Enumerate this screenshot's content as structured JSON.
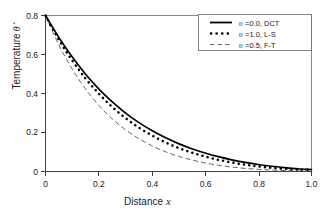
{
  "chart_data": {
    "type": "line",
    "title": "",
    "xlabel": "Distance x",
    "ylabel": "Temperature θ",
    "ylabel_sub": "*",
    "xlim": [
      0,
      1.0
    ],
    "ylim": [
      0,
      0.8
    ],
    "grid": false,
    "legend_position": "upper-right",
    "xticks": [
      "0",
      "0.2",
      "0.4",
      "0.6",
      "0.8",
      "1.0"
    ],
    "xtick_values": [
      0,
      0.2,
      0.4,
      0.6,
      0.8,
      1.0
    ],
    "yticks": [
      "0",
      "0.2",
      "0.4",
      "0.6",
      "0.8"
    ],
    "ytick_values": [
      0,
      0.2,
      0.4,
      0.6,
      0.8
    ],
    "x": [
      0,
      0.05,
      0.1,
      0.15,
      0.2,
      0.25,
      0.3,
      0.35,
      0.4,
      0.45,
      0.5,
      0.55,
      0.6,
      0.65,
      0.7,
      0.75,
      0.8,
      0.85,
      0.9,
      0.95,
      1.0
    ],
    "series": [
      {
        "name": "υ =0.0, DCT",
        "style": "solid",
        "color": "#000000",
        "values": [
          0.8,
          0.688,
          0.588,
          0.5,
          0.424,
          0.358,
          0.301,
          0.252,
          0.21,
          0.174,
          0.143,
          0.117,
          0.095,
          0.076,
          0.06,
          0.047,
          0.036,
          0.027,
          0.02,
          0.014,
          0.01
        ]
      },
      {
        "name": "υ =1.0, L-S",
        "style": "dotted",
        "color": "#000000",
        "values": [
          0.8,
          0.676,
          0.57,
          0.478,
          0.4,
          0.332,
          0.275,
          0.226,
          0.185,
          0.15,
          0.121,
          0.097,
          0.077,
          0.06,
          0.046,
          0.035,
          0.026,
          0.019,
          0.014,
          0.01,
          0.008
        ]
      },
      {
        "name": "υ =0.5, F-T",
        "style": "dashed",
        "color": "#555555",
        "values": [
          0.8,
          0.65,
          0.526,
          0.424,
          0.34,
          0.271,
          0.215,
          0.169,
          0.132,
          0.102,
          0.078,
          0.059,
          0.044,
          0.032,
          0.023,
          0.016,
          0.011,
          0.008,
          0.005,
          0.003,
          0.002
        ]
      }
    ]
  },
  "legend": {
    "entries": [
      {
        "symbol": "υ",
        "text": " =0.0, DCT"
      },
      {
        "symbol": "υ",
        "text": " =1.0, L-S"
      },
      {
        "symbol": "υ",
        "text": " =0.5, F-T"
      }
    ]
  },
  "axes": {
    "x_title_main": "Distance",
    "x_title_var": "x",
    "y_title_main": "Temperature",
    "y_title_var": "θ",
    "y_title_sub": "*"
  }
}
